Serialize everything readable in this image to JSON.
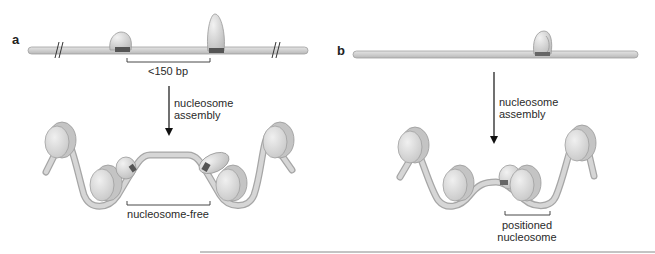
{
  "panels": [
    {
      "letter": "a",
      "top_label": "<150 bp",
      "arrow_label_line1": "nucleosome",
      "arrow_label_line2": "assembly",
      "bottom_label": "nucleosome-free"
    },
    {
      "letter": "b",
      "arrow_label_line1": "nucleosome",
      "arrow_label_line2": "assembly",
      "bottom_label_line1": "positioned",
      "bottom_label_line2": "nucleosome"
    }
  ],
  "colors": {
    "dna": "#cfcfcf",
    "dna_stroke": "#9a9a9a",
    "histone": "#dcdcdc",
    "histone_stroke": "#a8a8a8",
    "protein": "#d6d6d6",
    "binding_site": "#555555",
    "text": "#2a2a2a"
  }
}
